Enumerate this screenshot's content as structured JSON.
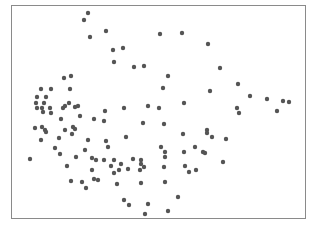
{
  "chart_data": {
    "type": "scatter",
    "title": "",
    "xlabel": "",
    "ylabel": "",
    "grid": false,
    "legend": null,
    "axes_visible": false,
    "frame": {
      "x0": 11,
      "y0": 5,
      "x1": 305,
      "y1": 218
    },
    "colors": {
      "point": "#555555",
      "frame": "#8a8a8a",
      "background": "#ffffff"
    },
    "point_radius": 2.2,
    "note": "Coordinates are pixel positions within the 315x228 frame; no tick labels are visible.",
    "points": [
      [
        88,
        13
      ],
      [
        84,
        20
      ],
      [
        90,
        37
      ],
      [
        106,
        31
      ],
      [
        160,
        34
      ],
      [
        182,
        33
      ],
      [
        113,
        50
      ],
      [
        123,
        48
      ],
      [
        114,
        62
      ],
      [
        134,
        67
      ],
      [
        144,
        66
      ],
      [
        168,
        76
      ],
      [
        163,
        88
      ],
      [
        208,
        44
      ],
      [
        220,
        68
      ],
      [
        238,
        84
      ],
      [
        250,
        96
      ],
      [
        267,
        99
      ],
      [
        283,
        101
      ],
      [
        289,
        102
      ],
      [
        237,
        108
      ],
      [
        239,
        113
      ],
      [
        277,
        111
      ],
      [
        210,
        91
      ],
      [
        184,
        103
      ],
      [
        159,
        108
      ],
      [
        148,
        106
      ],
      [
        124,
        108
      ],
      [
        105,
        111
      ],
      [
        104,
        121
      ],
      [
        64,
        78
      ],
      [
        71,
        76
      ],
      [
        70,
        89
      ],
      [
        41,
        89
      ],
      [
        51,
        89
      ],
      [
        37,
        97
      ],
      [
        46,
        97
      ],
      [
        36,
        103
      ],
      [
        44,
        103
      ],
      [
        37,
        108
      ],
      [
        42,
        108
      ],
      [
        50,
        108
      ],
      [
        43,
        112
      ],
      [
        51,
        113
      ],
      [
        63,
        108
      ],
      [
        65,
        106
      ],
      [
        69,
        103
      ],
      [
        75,
        107
      ],
      [
        78,
        106
      ],
      [
        80,
        116
      ],
      [
        61,
        119
      ],
      [
        94,
        119
      ],
      [
        35,
        128
      ],
      [
        42,
        127
      ],
      [
        45,
        130
      ],
      [
        46,
        132
      ],
      [
        65,
        130
      ],
      [
        73,
        127
      ],
      [
        75,
        129
      ],
      [
        72,
        134
      ],
      [
        41,
        140
      ],
      [
        59,
        138
      ],
      [
        88,
        140
      ],
      [
        106,
        141
      ],
      [
        108,
        147
      ],
      [
        126,
        137
      ],
      [
        143,
        123
      ],
      [
        164,
        124
      ],
      [
        183,
        134
      ],
      [
        207,
        130
      ],
      [
        207,
        133
      ],
      [
        212,
        137
      ],
      [
        226,
        139
      ],
      [
        55,
        148
      ],
      [
        85,
        150
      ],
      [
        60,
        154
      ],
      [
        76,
        157
      ],
      [
        30,
        159
      ],
      [
        67,
        166
      ],
      [
        92,
        158
      ],
      [
        96,
        160
      ],
      [
        104,
        160
      ],
      [
        114,
        160
      ],
      [
        133,
        159
      ],
      [
        141,
        160
      ],
      [
        141,
        164
      ],
      [
        161,
        147
      ],
      [
        165,
        152
      ],
      [
        165,
        157
      ],
      [
        195,
        147
      ],
      [
        203,
        152
      ],
      [
        205,
        153
      ],
      [
        184,
        152
      ],
      [
        92,
        170
      ],
      [
        111,
        166
      ],
      [
        114,
        173
      ],
      [
        119,
        170
      ],
      [
        121,
        164
      ],
      [
        128,
        169
      ],
      [
        140,
        170
      ],
      [
        144,
        167
      ],
      [
        164,
        167
      ],
      [
        185,
        166
      ],
      [
        196,
        170
      ],
      [
        189,
        172
      ],
      [
        223,
        162
      ],
      [
        71,
        181
      ],
      [
        82,
        182
      ],
      [
        86,
        188
      ],
      [
        94,
        179
      ],
      [
        98,
        180
      ],
      [
        117,
        184
      ],
      [
        141,
        183
      ],
      [
        165,
        182
      ],
      [
        124,
        200
      ],
      [
        129,
        205
      ],
      [
        148,
        204
      ],
      [
        145,
        214
      ],
      [
        168,
        211
      ],
      [
        178,
        197
      ]
    ]
  }
}
